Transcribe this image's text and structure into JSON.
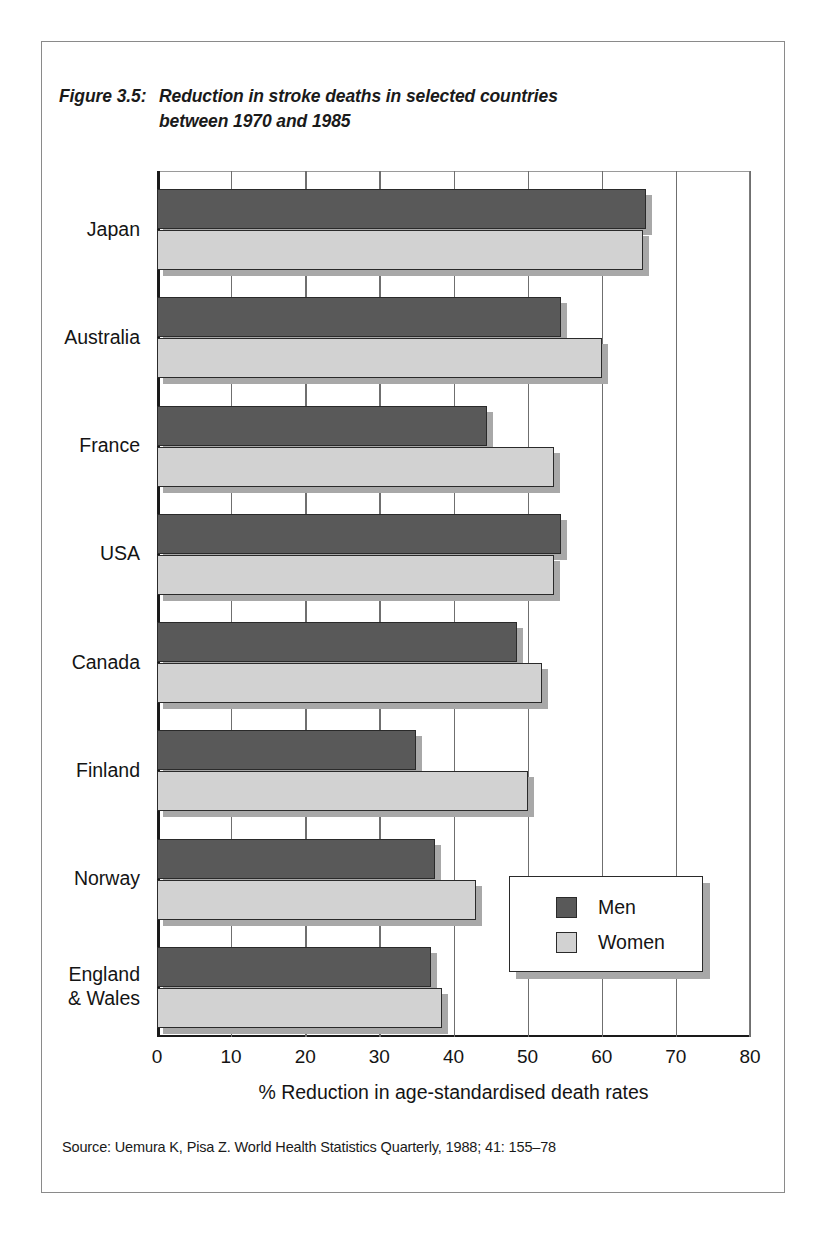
{
  "figure": {
    "label": "Figure 3.5:",
    "title_line1": "Reduction in stroke deaths in selected countries",
    "title_line2": "between 1970 and 1985",
    "title_full": "Reduction in stroke deaths in selected countries between 1970 and 1985"
  },
  "source": {
    "text": "Source: Uemura K, Pisa Z. World Health Statistics Quarterly, 1988; 41: 155–78"
  },
  "legend": {
    "men_label": "Men",
    "women_label": "Women"
  },
  "colors": {
    "men": "#595959",
    "women": "#d2d2d2",
    "outline": "#2a2a2a",
    "shadow": "#a8a8a8",
    "frame": "#8a8a8a",
    "gridline": "#6f6f6f"
  },
  "chart_data": {
    "type": "bar",
    "orientation": "horizontal",
    "subtitle": "",
    "xlabel": "% Reduction in age-standardised death rates",
    "ylabel": "",
    "xlim": [
      0,
      80
    ],
    "xticks": [
      0,
      10,
      20,
      30,
      40,
      50,
      60,
      70,
      80
    ],
    "xtick_labels": [
      "0",
      "10",
      "20",
      "30",
      "40",
      "50",
      "60",
      "70",
      "80"
    ],
    "grid": "vertical",
    "legend_position": "inside-bottom-right",
    "categories": [
      "Japan",
      "Australia",
      "France",
      "USA",
      "Canada",
      "Finland",
      "Norway",
      "England\n& Wales"
    ],
    "series": [
      {
        "name": "Men",
        "values": [
          66,
          54.5,
          44.5,
          54.5,
          48.5,
          35,
          37.5,
          37
        ]
      },
      {
        "name": "Women",
        "values": [
          65.5,
          60,
          53.5,
          53.5,
          52,
          50,
          43,
          38.5
        ]
      }
    ],
    "source": "Uemura K, Pisa Z. World Health Statistics Quarterly, 1988; 41: 155–78"
  }
}
